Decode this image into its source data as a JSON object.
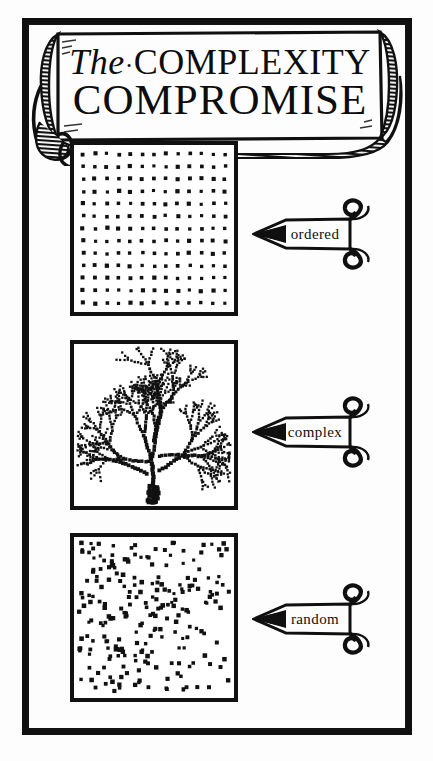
{
  "illustration": {
    "kind": "woodcut-diagram",
    "title": {
      "word_the": "The",
      "separator": "·",
      "word_complexity": "COMPLEXITY",
      "line2": "COMPROMISE",
      "full": "The·COMPLEXITY COMPROMISE"
    },
    "ink_color": "#101010",
    "paper_color": "#fdfdfd"
  },
  "panels": [
    {
      "id": "ordered",
      "label": "ordered",
      "pattern": "regular-grid",
      "description": "evenly spaced square lattice of dots",
      "grid_cols": 13,
      "grid_rows": 13
    },
    {
      "id": "complex",
      "label": "complex",
      "pattern": "branching-tree",
      "description": "dotted fractal tree branching from bottom centre",
      "branch_levels": 5
    },
    {
      "id": "random",
      "label": "random",
      "pattern": "scatter",
      "description": "randomly scattered dots filling the square",
      "dot_count": 230
    }
  ],
  "chart_data": {
    "type": "scatter",
    "title": "The·COMPLEXITY COMPROMISE",
    "xlabel": "",
    "ylabel": "",
    "legend_position": "right",
    "grid": false,
    "series": [
      {
        "name": "ordered",
        "pattern": "regular-grid",
        "n_points": 169,
        "order_parameter": 1.0
      },
      {
        "name": "complex",
        "pattern": "branching-tree",
        "n_points": 340,
        "order_parameter": 0.5
      },
      {
        "name": "random",
        "pattern": "uniform-random",
        "n_points": 230,
        "order_parameter": 0.0
      }
    ],
    "categories": [
      "ordered",
      "complex",
      "random"
    ],
    "values": [
      1.0,
      0.5,
      0.0
    ]
  }
}
